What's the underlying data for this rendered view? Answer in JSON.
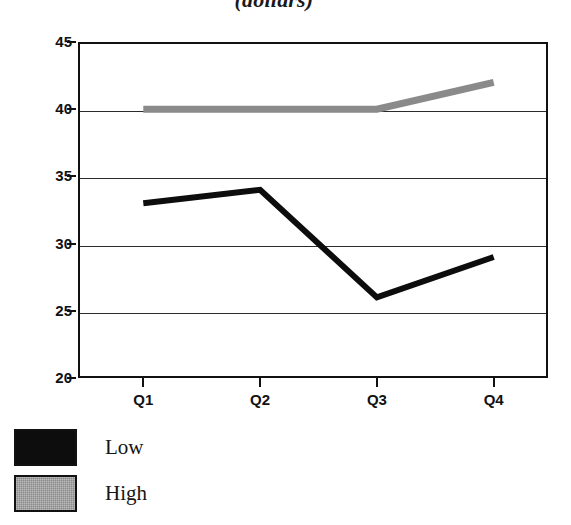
{
  "chart_data": {
    "type": "line",
    "title": "(dollars)",
    "xlabel": "",
    "ylabel": "",
    "categories": [
      "Q1",
      "Q2",
      "Q3",
      "Q4"
    ],
    "series": [
      {
        "name": "Low",
        "values": [
          33,
          34,
          26,
          29
        ],
        "color": "#0d0d0d"
      },
      {
        "name": "High",
        "values": [
          40,
          40,
          40,
          42
        ],
        "color": "#8a8a8a"
      }
    ],
    "ylim": [
      20,
      45
    ],
    "yticks": [
      45,
      40,
      35,
      30,
      25,
      20
    ],
    "grid": true,
    "legend_position": "bottom-left"
  },
  "axes": {
    "y_tick_labels": [
      "45",
      "40",
      "35",
      "30",
      "25",
      "20"
    ],
    "x_tick_labels": [
      "Q1",
      "Q2",
      "Q3",
      "Q4"
    ]
  },
  "legend": {
    "items": [
      {
        "label": "Low",
        "swatch": "black-swatch"
      },
      {
        "label": "High",
        "swatch": "gray-swatch"
      }
    ]
  }
}
